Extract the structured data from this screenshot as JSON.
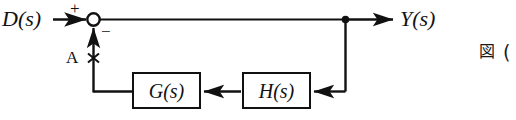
{
  "diagram": {
    "type": "control-system-block-diagram",
    "input_label": "D(s)",
    "output_label": "Y(s)",
    "sum_plus_sign": "+",
    "sum_minus_sign": "−",
    "point_label": "A",
    "point_marker": "×",
    "blocks": [
      {
        "id": "G",
        "label": "G(s)"
      },
      {
        "id": "H",
        "label": "H(s)"
      }
    ],
    "caption": {
      "figure_word": "図",
      "figure_number": "("
    },
    "colors": {
      "line": "#111111",
      "text": "#111111",
      "background": "#ffffff"
    }
  }
}
